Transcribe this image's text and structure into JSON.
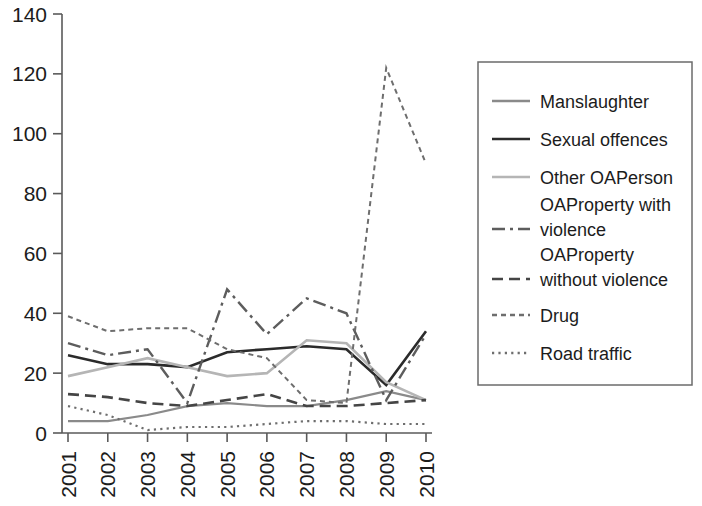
{
  "chart_data": {
    "type": "line",
    "title": "",
    "xlabel": "",
    "ylabel": "",
    "x": [
      "2001",
      "2002",
      "2003",
      "2004",
      "2005",
      "2006",
      "2007",
      "2008",
      "2009",
      "2010"
    ],
    "categories": [
      "2001",
      "2002",
      "2003",
      "2004",
      "2005",
      "2006",
      "2007",
      "2008",
      "2009",
      "2010"
    ],
    "ylim": [
      0,
      140
    ],
    "yticks": [
      0,
      20,
      40,
      60,
      80,
      100,
      120,
      140
    ],
    "ytick_labels": [
      "0",
      "20",
      "40",
      "60",
      "80",
      "100",
      "120",
      "140"
    ],
    "xtick_labels": [
      "2001",
      "2002",
      "2003",
      "2004",
      "2005",
      "2006",
      "2007",
      "2008",
      "2009",
      "2010"
    ],
    "grid": false,
    "legend_position": "right",
    "series": [
      {
        "name": "Manslaughter",
        "style": "solid",
        "color": "#8a8a8a",
        "width": 2.2,
        "values": [
          4,
          4,
          6,
          9,
          10,
          9,
          9,
          11,
          14,
          11
        ]
      },
      {
        "name": "Sexual offences",
        "style": "solid",
        "color": "#2b2b2b",
        "width": 2.6,
        "values": [
          26,
          23,
          23,
          22,
          27,
          28,
          29,
          28,
          16,
          34
        ]
      },
      {
        "name": "Other OAPerson",
        "style": "solid",
        "color": "#b5b5b5",
        "width": 2.6,
        "values": [
          19,
          22,
          25,
          22,
          19,
          20,
          31,
          30,
          17,
          11
        ]
      },
      {
        "name": "OAProperty with violence",
        "style": "dashdot",
        "color": "#5d5d5d",
        "width": 2.4,
        "values": [
          30,
          26,
          28,
          10,
          48,
          33,
          45,
          40,
          11,
          33
        ]
      },
      {
        "name": "OAProperty without violence",
        "style": "dashed",
        "color": "#454545",
        "width": 2.6,
        "values": [
          13,
          12,
          10,
          9,
          11,
          13,
          9,
          9,
          10,
          11
        ]
      },
      {
        "name": "Drug",
        "style": "dotted-dash",
        "color": "#6e6e6e",
        "width": 2.0,
        "values": [
          39,
          34,
          35,
          35,
          28,
          25,
          11,
          10,
          122,
          90
        ]
      },
      {
        "name": "Road traffic",
        "style": "dotted",
        "color": "#6e6e6e",
        "width": 2.2,
        "values": [
          9,
          6,
          1,
          2,
          2,
          3,
          4,
          4,
          3,
          3
        ]
      }
    ],
    "legend_entries": [
      {
        "label": "Manslaughter",
        "style": "solid",
        "color": "#8a8a8a"
      },
      {
        "label": "Sexual offences",
        "style": "solid",
        "color": "#2b2b2b"
      },
      {
        "label": "Other OAPerson",
        "style": "solid",
        "color": "#b5b5b5"
      },
      {
        "label": "OAProperty with violence",
        "style": "dashdot",
        "color": "#5d5d5d"
      },
      {
        "label": "OAProperty without violence",
        "style": "dashed",
        "color": "#454545"
      },
      {
        "label": "Drug",
        "style": "dotted-dash",
        "color": "#6e6e6e"
      },
      {
        "label": "Road traffic",
        "style": "dotted",
        "color": "#6e6e6e"
      }
    ]
  }
}
